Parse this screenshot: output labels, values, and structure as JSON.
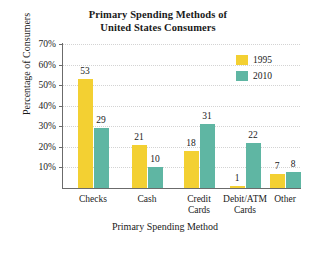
{
  "chart_data": {
    "type": "bar",
    "title": "Primary Spending Methods of United States Consumers",
    "title_lines": [
      "Primary Spending Methods of",
      "United States Consumers"
    ],
    "xlabel": "Primary Spending Method",
    "ylabel": "Percentage of Consumers",
    "categories": [
      "Checks",
      "Cash",
      "Credit Cards",
      "Debit/ATM Cards",
      "Other"
    ],
    "category_lines": [
      [
        "Checks"
      ],
      [
        "Cash"
      ],
      [
        "Credit",
        "Cards"
      ],
      [
        "Debit/ATM",
        "Cards"
      ],
      [
        "Other"
      ]
    ],
    "series": [
      {
        "name": "1995",
        "color": "#f3d032",
        "values": [
          53,
          21,
          18,
          1,
          7
        ]
      },
      {
        "name": "2010",
        "color": "#5fb6a3",
        "values": [
          29,
          10,
          31,
          22,
          8
        ]
      }
    ],
    "ylim": [
      0,
      70
    ],
    "ytick_values": [
      10,
      20,
      30,
      40,
      50,
      60,
      70
    ],
    "ytick_labels": [
      "10%",
      "20%",
      "30%",
      "40%",
      "50%",
      "60%",
      "70%"
    ],
    "grid": true,
    "grid_axis": "y",
    "legend_position": "top-right",
    "value_labels": true
  },
  "legend": {
    "entries": [
      {
        "label": "1995"
      },
      {
        "label": "2010"
      }
    ]
  }
}
